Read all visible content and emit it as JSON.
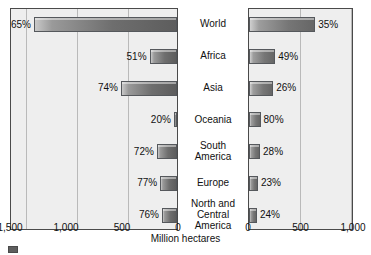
{
  "chart_data": {
    "type": "bar",
    "orientation": "horizontal",
    "layout": "back-to-back bidirectional bar chart (two panels sharing category labels)",
    "title": "",
    "xlabel": "Million hectares",
    "ylabel": "",
    "grid": true,
    "legend_position": "bottom-left (clipped)",
    "categories": [
      "World",
      "Africa",
      "Asia",
      "Oceania",
      "South America",
      "Europe",
      "North and Central America"
    ],
    "category_display": [
      [
        "World"
      ],
      [
        "Africa"
      ],
      [
        "Asia"
      ],
      [
        "Oceania"
      ],
      [
        "South",
        "America"
      ],
      [
        "Europe"
      ],
      [
        "North and",
        "Central",
        "America"
      ]
    ],
    "panels": [
      {
        "name": "left-panel",
        "direction": "right-to-left",
        "axis_ticks": [
          1500,
          1000,
          500,
          0
        ],
        "xlim": [
          1500,
          0
        ],
        "values": [
          1370,
          245,
          500,
          28,
          180,
          150,
          135
        ],
        "data_labels": [
          "65%",
          "51%",
          "74%",
          "20%",
          "72%",
          "77%",
          "76%"
        ]
      },
      {
        "name": "right-panel",
        "direction": "left-to-right",
        "axis_ticks": [
          0,
          500,
          1000
        ],
        "xlim": [
          0,
          1000
        ],
        "values": [
          630,
          250,
          230,
          110,
          105,
          85,
          75
        ],
        "data_labels": [
          "35%",
          "49%",
          "26%",
          "80%",
          "28%",
          "23%",
          "24%"
        ]
      }
    ],
    "series": [
      {
        "name": "left-series",
        "values": [
          1370,
          245,
          500,
          28,
          180,
          150,
          135
        ]
      },
      {
        "name": "right-series",
        "values": [
          630,
          250,
          230,
          110,
          105,
          85,
          75
        ]
      }
    ]
  },
  "axis": {
    "left_ticks": [
      "1,500",
      "1,000",
      "500",
      "0"
    ],
    "right_ticks": [
      "0",
      "500",
      "1,000"
    ],
    "title": "Million hectares"
  },
  "legend": {
    "items": [
      {
        "label": "",
        "color": "#5e5e5e"
      }
    ]
  },
  "colors": {
    "plot_background": "#eeeeee",
    "panel_border": "#4a4a4a",
    "gridline": "#b9b9b9",
    "bar_dark": "#5d5d5d",
    "bar_light": "#c9c9c9",
    "text": "#111111",
    "page_background": "#ffffff"
  }
}
